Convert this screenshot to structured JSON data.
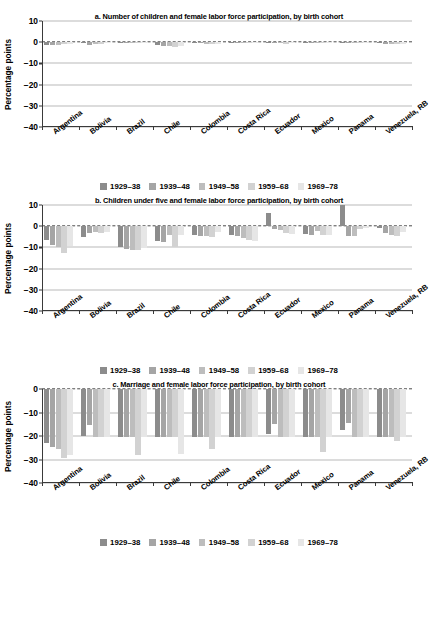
{
  "figure": {
    "ylabel": "Percentage points",
    "legend_labels": [
      "1929–38",
      "1939–48",
      "1949–58",
      "1959–68",
      "1969–78"
    ],
    "series_colors": [
      "#8c8c8c",
      "#a5a5a5",
      "#bdbdbd",
      "#d2d2d2",
      "#e6e6e6"
    ],
    "countries": [
      "Argentina",
      "Bolivia",
      "Brazil",
      "Chile",
      "Colombia",
      "Costa Rica",
      "Ecuador",
      "Mexico",
      "Panama",
      "Venezuela, RB"
    ]
  },
  "chart_data": [
    {
      "type": "bar",
      "panel": "a",
      "title": "a. Number of children and female labor force participation, by birth cohort",
      "xlabel": "",
      "ylabel": "Percentage points",
      "ylim": [
        -40,
        10
      ],
      "yticks": [
        10,
        0,
        -10,
        -20,
        -30,
        -40
      ],
      "ytick_labels": [
        "10",
        "0",
        "−10",
        "−20",
        "−30",
        "−40"
      ],
      "grid": true,
      "legend_position": "below",
      "categories": [
        "Argentina",
        "Bolivia",
        "Brazil",
        "Chile",
        "Colombia",
        "Costa Rica",
        "Ecuador",
        "Mexico",
        "Panama",
        "Venezuela, RB"
      ],
      "series": [
        {
          "name": "1929–38",
          "values": [
            -1.4,
            -0.5,
            -0.4,
            -1.2,
            -0.5,
            -0.3,
            -0.4,
            -0.3,
            -0.2,
            -0.5
          ]
        },
        {
          "name": "1939–48",
          "values": [
            -1.3,
            -1.1,
            -0.4,
            -1.6,
            -0.6,
            -0.4,
            -0.5,
            -0.4,
            -0.3,
            -0.7
          ]
        },
        {
          "name": "1949–58",
          "values": [
            -1.2,
            -1.0,
            -0.5,
            -2.0,
            -0.7,
            -0.5,
            -0.6,
            -0.5,
            -0.4,
            -0.9
          ]
        },
        {
          "name": "1959–68",
          "values": [
            -1.0,
            -0.8,
            -0.5,
            -2.1,
            -0.8,
            -0.6,
            -0.7,
            -0.6,
            -0.5,
            -1.0
          ]
        },
        {
          "name": "1969–78",
          "values": [
            -0.8,
            -0.6,
            -0.4,
            -1.8,
            -0.7,
            -0.5,
            -0.6,
            -0.5,
            -0.4,
            -0.9
          ]
        }
      ]
    },
    {
      "type": "bar",
      "panel": "b",
      "title": "b. Children under five and female labor force participation, by birth cohort",
      "xlabel": "",
      "ylabel": "Percentage points",
      "ylim": [
        -40,
        10
      ],
      "yticks": [
        10,
        0,
        -10,
        -20,
        -30,
        -40
      ],
      "ytick_labels": [
        "10",
        "0",
        "−10",
        "−20",
        "−30",
        "−40"
      ],
      "grid": true,
      "legend_position": "above",
      "categories": [
        "Argentina",
        "Bolivia",
        "Brazil",
        "Chile",
        "Colombia",
        "Costa Rica",
        "Ecuador",
        "Mexico",
        "Panama",
        "Venezuela, RB"
      ],
      "series": [
        {
          "name": "1929–38",
          "values": [
            -6.5,
            -5.2,
            -9.8,
            -6.8,
            -4.2,
            -4.0,
            6.2,
            -3.6,
            10.0,
            -1.0
          ]
        },
        {
          "name": "1939–48",
          "values": [
            -8.8,
            -3.4,
            -10.6,
            -7.6,
            -4.6,
            -4.4,
            -1.2,
            -4.3,
            -4.6,
            -3.4
          ]
        },
        {
          "name": "1949–58",
          "values": [
            -9.6,
            -2.6,
            -11.2,
            -4.0,
            -4.8,
            -5.4,
            -1.6,
            -2.4,
            -4.5,
            -4.2
          ]
        },
        {
          "name": "1959–68",
          "values": [
            -12.8,
            -3.2,
            -11.0,
            -9.6,
            -5.2,
            -6.4,
            -3.2,
            -4.0,
            -1.2,
            -4.4
          ]
        },
        {
          "name": "1969–78",
          "values": [
            -9.4,
            -2.8,
            -10.2,
            -4.2,
            -2.6,
            -7.2,
            -3.6,
            -4.2,
            -1.0,
            -2.8
          ]
        }
      ]
    },
    {
      "type": "bar",
      "panel": "c",
      "title": "c. Marriage and female labor force participation, by birth cohort",
      "xlabel": "",
      "ylabel": "Percentage points",
      "ylim": [
        -40,
        0
      ],
      "yticks": [
        0,
        -10,
        -20,
        -30,
        -40
      ],
      "ytick_labels": [
        "0",
        "−10",
        "−20",
        "−30",
        "−40"
      ],
      "grid": true,
      "legend_position": "both",
      "categories": [
        "Argentina",
        "Bolivia",
        "Brazil",
        "Chile",
        "Colombia",
        "Costa Rica",
        "Ecuador",
        "Mexico",
        "Panama",
        "Venezuela, RB"
      ],
      "series": [
        {
          "name": "1929–38",
          "values": [
            -23.0,
            -20.0,
            -20.5,
            -20.5,
            -20.5,
            -20.5,
            -19.0,
            -20.5,
            -17.5,
            -20.5
          ]
        },
        {
          "name": "1939–48",
          "values": [
            -24.5,
            -15.5,
            -20.5,
            -20.5,
            -20.5,
            -20.5,
            -15.0,
            -20.5,
            -14.5,
            -20.5
          ]
        },
        {
          "name": "1949–58",
          "values": [
            -25.5,
            -20.5,
            -20.5,
            -20.5,
            -20.5,
            -20.5,
            -20.5,
            -20.5,
            -20.5,
            -20.5
          ]
        },
        {
          "name": "1959–68",
          "values": [
            -29.5,
            -20.5,
            -28.0,
            -20.5,
            -25.5,
            -20.5,
            -20.5,
            -27.0,
            -20.5,
            -22.0
          ]
        },
        {
          "name": "1969–78",
          "values": [
            -28.0,
            -20.5,
            -20.5,
            -27.5,
            -20.5,
            -20.5,
            -20.5,
            -20.5,
            -20.5,
            -20.5
          ]
        }
      ]
    }
  ]
}
